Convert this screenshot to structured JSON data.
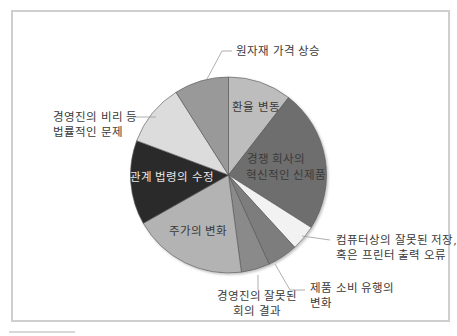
{
  "chart_data": {
    "type": "pie",
    "title": "",
    "start_angle_deg": 0,
    "direction": "clockwise",
    "slices": [
      {
        "label": "환율 변동",
        "value": 10.5,
        "color": "#bdbdbd",
        "label_position": "inside"
      },
      {
        "label": "경쟁 회사의 혁신적인 신제품",
        "value": 23.5,
        "color": "#6e6e6e",
        "label_position": "inside"
      },
      {
        "label": "컴퓨터상의 잘못된 저장, 혹은 프린터 출력 오류",
        "value": 4.2,
        "color": "#f2f2f2",
        "label_position": "outside"
      },
      {
        "label": "제품 소비 유행의 변화",
        "value": 5.0,
        "color": "#7d7d7d",
        "label_position": "outside"
      },
      {
        "label": "경영진의 잘못된 회의 결과",
        "value": 4.7,
        "color": "#8a8a8a",
        "label_position": "outside"
      },
      {
        "label": "주가의 변화",
        "value": 18.9,
        "color": "#b3b3b3",
        "label_position": "inside"
      },
      {
        "label": "관계 법령의 수정",
        "value": 13.9,
        "color": "#2c2c2c",
        "label_position": "inside"
      },
      {
        "label": "경영진의 비리 등 법률적인 문제",
        "value": 10.3,
        "color": "#dcdcdc",
        "label_position": "outside"
      },
      {
        "label": "원자재 가격 상승",
        "value": 9.0,
        "color": "#999999",
        "label_position": "outside"
      }
    ],
    "categories": [
      "환율 변동",
      "경쟁 회사의 혁신적인 신제품",
      "컴퓨터상의 잘못된 저장, 혹은 프린터 출력 오류",
      "제품 소비 유행의 변화",
      "경영진의 잘못된 회의 결과",
      "주가의 변화",
      "관계 법령의 수정",
      "경영진의 비리 등 법률적인 문제",
      "원자재 가격 상승"
    ],
    "values": [
      10.5,
      23.5,
      4.2,
      5.0,
      4.7,
      18.9,
      13.9,
      10.3,
      9.0
    ],
    "legend": "none",
    "grid": false
  },
  "labels": {
    "exchange": "환율 변동",
    "competitor_line1": "경쟁 회사의",
    "competitor_line2": "혁신적인 신제품",
    "computer_line1": "컴퓨터상의 잘못된 저장,",
    "computer_line2": "혹은 프린터 출력 오류",
    "trend_line1": "제품 소비 유행의",
    "trend_line2": "변화",
    "meeting_line1": "경영진의 잘못된",
    "meeting_line2": "회의 결과",
    "stock": "주가의 변화",
    "law": "관계 법령의 수정",
    "corruption_line1": "경영진의 비리 등",
    "corruption_line2": "법률적인 문제",
    "rawmaterial": "원자재 가격 상승"
  }
}
